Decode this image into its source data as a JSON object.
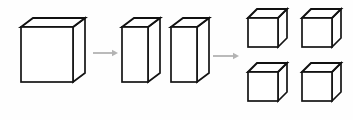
{
  "figure": {
    "background_color": "#fefefe",
    "edge_color": "#141414",
    "face_color": "#ffffff",
    "arrow_color": "#b3b3b3",
    "width": 353,
    "height": 120
  },
  "stages": [
    {
      "id": "stage-1",
      "label": "single-large-cube",
      "count": 1,
      "shapes": [
        {
          "name": "large-cube",
          "x": 21,
          "y": 27,
          "w": 52,
          "h": 55,
          "dx": 12,
          "dy": -9
        }
      ]
    },
    {
      "id": "stage-2",
      "label": "two-slabs",
      "count": 2,
      "shapes": [
        {
          "name": "slab-left",
          "x": 122,
          "y": 27,
          "w": 26,
          "h": 55,
          "dx": 12,
          "dy": -9
        },
        {
          "name": "slab-right",
          "x": 171,
          "y": 27,
          "w": 26,
          "h": 55,
          "dx": 12,
          "dy": -9
        }
      ]
    },
    {
      "id": "stage-3",
      "label": "four-small-cubes",
      "count": 4,
      "shapes": [
        {
          "name": "small-cube-top-left",
          "x": 248,
          "y": 18,
          "w": 30,
          "h": 29,
          "dx": 9,
          "dy": -9
        },
        {
          "name": "small-cube-top-right",
          "x": 302,
          "y": 18,
          "w": 30,
          "h": 29,
          "dx": 9,
          "dy": -9
        },
        {
          "name": "small-cube-bottom-left",
          "x": 248,
          "y": 72,
          "w": 30,
          "h": 29,
          "dx": 9,
          "dy": -9
        },
        {
          "name": "small-cube-bottom-right",
          "x": 302,
          "y": 72,
          "w": 30,
          "h": 29,
          "dx": 9,
          "dy": -9
        }
      ]
    }
  ],
  "arrows": [
    {
      "name": "arrow-stage1-to-stage2",
      "x1": 93,
      "y1": 53,
      "x2": 118,
      "y2": 53
    },
    {
      "name": "arrow-stage2-to-stage3",
      "x1": 213,
      "y1": 56,
      "x2": 239,
      "y2": 56
    }
  ]
}
